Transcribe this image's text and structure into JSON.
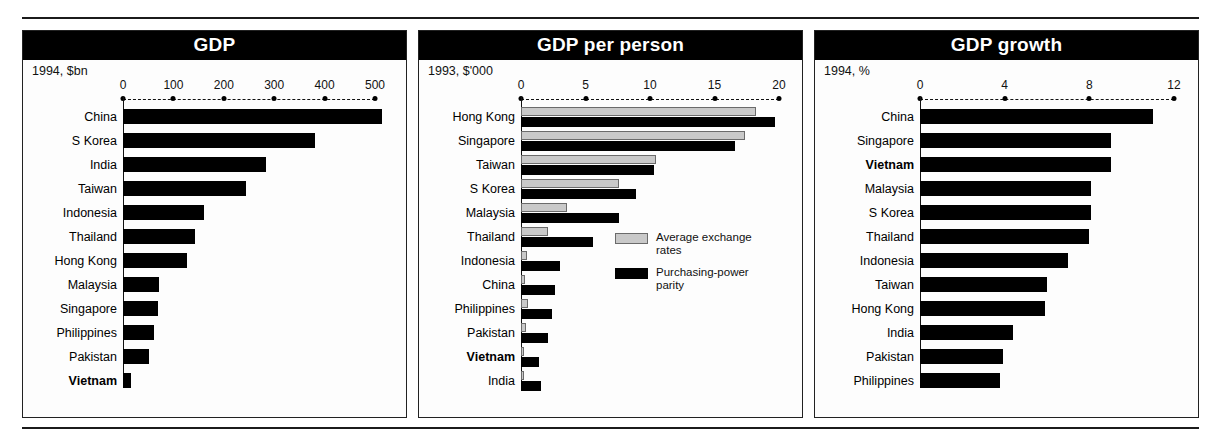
{
  "chart_data": [
    {
      "type": "bar",
      "title": "GDP",
      "subtitle": "1994, $bn",
      "xlabel": "",
      "ylabel": "",
      "xlim": [
        0,
        540
      ],
      "ticks": [
        0,
        100,
        200,
        300,
        400,
        500
      ],
      "tick_labels": [
        "0",
        "100",
        "200",
        "300",
        "400",
        "500"
      ],
      "grid": false,
      "legend": null,
      "highlight": "Vietnam",
      "categories": [
        "China",
        "S Korea",
        "India",
        "Taiwan",
        "Indonesia",
        "Thailand",
        "Hong Kong",
        "Malaysia",
        "Singapore",
        "Philippines",
        "Pakistan",
        "Vietnam"
      ],
      "values": [
        514,
        380,
        283,
        244,
        160,
        142,
        126,
        71,
        69,
        61,
        51,
        16
      ]
    },
    {
      "type": "bar",
      "title": "GDP per person",
      "subtitle": "1993, $'000",
      "xlabel": "",
      "ylabel": "",
      "xlim": [
        0,
        21
      ],
      "ticks": [
        0,
        5,
        10,
        15,
        20
      ],
      "tick_labels": [
        "0",
        "5",
        "10",
        "15",
        "20"
      ],
      "grid": false,
      "legend_position": "inside-right",
      "highlight": "Vietnam",
      "categories": [
        "Hong Kong",
        "Singapore",
        "Taiwan",
        "S Korea",
        "Malaysia",
        "Thailand",
        "Indonesia",
        "China",
        "Philippines",
        "Pakistan",
        "Vietnam",
        "India"
      ],
      "series": [
        {
          "name": "Average exchange rates",
          "color": "#c9c9c9",
          "values": [
            18.2,
            17.4,
            10.5,
            7.6,
            3.6,
            2.1,
            0.5,
            0.3,
            0.55,
            0.4,
            0.2,
            0.25
          ]
        },
        {
          "name": "Purchasing-power parity",
          "color": "#000000",
          "values": [
            19.7,
            16.6,
            10.3,
            8.9,
            7.6,
            5.6,
            3.0,
            2.6,
            2.4,
            2.1,
            1.4,
            1.55
          ]
        }
      ]
    },
    {
      "type": "bar",
      "title": "GDP growth",
      "subtitle": "1994, %",
      "xlabel": "",
      "ylabel": "",
      "xlim": [
        0,
        12.6
      ],
      "ticks": [
        0,
        4,
        8,
        12
      ],
      "tick_labels": [
        "0",
        "4",
        "8",
        "12"
      ],
      "grid": false,
      "legend": null,
      "highlight": "Vietnam",
      "categories": [
        "China",
        "Singapore",
        "Vietnam",
        "Malaysia",
        "S Korea",
        "Thailand",
        "Indonesia",
        "Taiwan",
        "Hong Kong",
        "India",
        "Pakistan",
        "Philippines"
      ],
      "values": [
        11.0,
        9.0,
        9.0,
        8.1,
        8.1,
        8.0,
        7.0,
        6.0,
        5.9,
        4.4,
        3.9,
        3.8
      ]
    }
  ],
  "legend_labels": {
    "exchange": "Average exchange\nrates",
    "ppp": "Purchasing-power\nparity"
  }
}
